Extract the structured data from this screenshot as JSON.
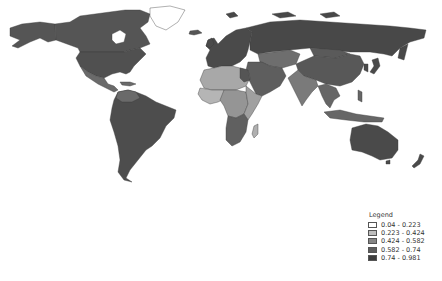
{
  "map": {
    "type": "choropleth world map",
    "region_shades": {
      "north_america": "#555555",
      "greenland": "#ffffff",
      "central_america": "#6a6a6a",
      "south_america": "#4d4d4d",
      "europe": "#4a4a4a",
      "russia": "#484848",
      "middle_east": "#5e5e5e",
      "central_asia": "#6e6e6e",
      "china": "#585858",
      "south_asia": "#7a7a7a",
      "southeast_asia": "#666666",
      "australia": "#4a4a4a",
      "north_africa": "#a8a8a8",
      "west_africa": "#b5b5b5",
      "central_africa": "#959595",
      "east_africa": "#a0a0a0",
      "southern_africa": "#606060",
      "madagascar": "#b0b0b0"
    }
  },
  "legend": {
    "title": "Legend",
    "items": [
      {
        "label": "0.04 - 0.223",
        "color": "#ffffff"
      },
      {
        "label": "0.223 - 0.424",
        "color": "#bdbdbd"
      },
      {
        "label": "0.424 - 0.582",
        "color": "#858585"
      },
      {
        "label": "0.582 - 0.74",
        "color": "#5c5c5c"
      },
      {
        "label": "0.74 - 0.981",
        "color": "#3d3d3d"
      }
    ]
  }
}
